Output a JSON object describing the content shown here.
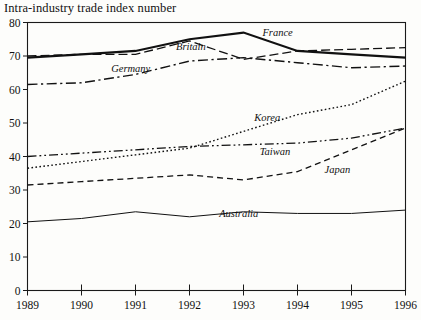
{
  "title": "Intra-industry trade index number",
  "chart_data": {
    "type": "line",
    "title": "Intra-industry trade index number",
    "xlabel": "",
    "ylabel": "",
    "x": [
      1989,
      1990,
      1991,
      1992,
      1993,
      1994,
      1995,
      1996
    ],
    "xtick_labels": [
      "1989",
      "1990",
      "1991",
      "1992",
      "1993",
      "1994",
      "1995",
      "1996"
    ],
    "ytick_labels": [
      "0",
      "10",
      "20",
      "30",
      "40",
      "50",
      "60",
      "70",
      "80"
    ],
    "yticks": [
      0,
      10,
      20,
      30,
      40,
      50,
      60,
      70,
      80
    ],
    "ylim": [
      0,
      80
    ],
    "xlim": [
      1989,
      1996
    ],
    "grid": false,
    "legend": "inline-labels",
    "series": [
      {
        "name": "France",
        "label": "France",
        "style": "solid-thick",
        "values": [
          69.5,
          70.5,
          71.5,
          75.0,
          77.0,
          71.5,
          70.5,
          69.5
        ],
        "label_x": 1993.35,
        "label_y": 76.0
      },
      {
        "name": "Britain",
        "label": "Britain",
        "style": "dashed",
        "values": [
          70.0,
          70.5,
          70.5,
          74.5,
          69.0,
          71.5,
          72.0,
          72.5
        ],
        "label_x": 1991.75,
        "label_y": 71.8
      },
      {
        "name": "Germany",
        "label": "Germany",
        "style": "dash-dot",
        "values": [
          61.5,
          62.0,
          64.5,
          68.5,
          69.5,
          68.0,
          66.5,
          67.0
        ],
        "label_x": 1990.55,
        "label_y": 65.3
      },
      {
        "name": "Korea",
        "label": "Korea",
        "style": "dotted",
        "values": [
          36.5,
          38.5,
          40.5,
          42.5,
          47.5,
          52.5,
          55.5,
          62.5
        ],
        "label_x": 1993.2,
        "label_y": 50.5
      },
      {
        "name": "Taiwan",
        "label": "Taiwan",
        "style": "dash-dot-dot",
        "values": [
          40.0,
          41.0,
          42.0,
          43.0,
          43.5,
          44.0,
          45.5,
          48.5
        ],
        "label_x": 1993.3,
        "label_y": 40.5
      },
      {
        "name": "Japan",
        "label": "Japan",
        "style": "dashed-short",
        "values": [
          31.5,
          32.5,
          33.5,
          34.5,
          33.0,
          35.5,
          42.0,
          48.5
        ],
        "label_x": 1994.5,
        "label_y": 35.0
      },
      {
        "name": "Australia",
        "label": "Australia",
        "style": "solid-thin",
        "values": [
          20.5,
          21.5,
          23.5,
          22.0,
          23.5,
          23.0,
          23.0,
          24.0
        ],
        "label_x": 1992.55,
        "label_y": 21.8
      }
    ]
  }
}
